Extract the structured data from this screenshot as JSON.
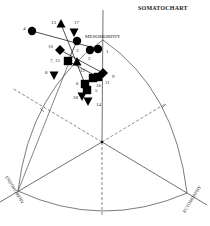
{
  "chart_data": {
    "type": "scatter",
    "title": "SOMATOCHART",
    "axes": {
      "mesomorphy": "MESOMORPHY",
      "endomorphy": "ENDOMORPHY",
      "ectomorphy": "ECTOMORPHY"
    },
    "geometry": {
      "center": [
        102,
        142
      ],
      "meso_apex": [
        103,
        40
      ],
      "endo_apex": [
        18,
        191
      ],
      "ecto_apex": [
        187,
        193
      ],
      "bottom": [
        102,
        217
      ]
    },
    "points": [
      {
        "label": "1",
        "shape": "circle",
        "x": 98,
        "y": 49,
        "lx": 106,
        "ly": 53
      },
      {
        "label": "2",
        "shape": "circle",
        "x": 90,
        "y": 50,
        "lx": 88,
        "ly": 60
      },
      {
        "label": "3",
        "shape": "circle",
        "x": 77,
        "y": 41,
        "lx": 76,
        "ly": 52
      },
      {
        "label": "4",
        "shape": "circle",
        "x": 32,
        "y": 31,
        "lx": 23,
        "ly": 30
      },
      {
        "label": "5",
        "shape": "square",
        "x": 87,
        "y": 90,
        "lx": 95,
        "ly": 92
      },
      {
        "label": "6",
        "shape": "square",
        "x": 85,
        "y": 84,
        "lx": 76,
        "ly": 85
      },
      {
        "label": "7, 15",
        "shape": "square",
        "x": 68,
        "y": 61,
        "lx": 50,
        "ly": 62
      },
      {
        "label": "8",
        "shape": "triangle-down",
        "x": 54,
        "y": 75,
        "lx": 45,
        "ly": 74
      },
      {
        "label": "9",
        "shape": "diamond",
        "x": 103,
        "y": 73,
        "lx": 112,
        "ly": 78
      },
      {
        "label": "10",
        "shape": "diamond",
        "x": 60,
        "y": 50,
        "lx": 48,
        "ly": 48
      },
      {
        "label": "11",
        "shape": "square",
        "x": 98,
        "y": 77,
        "lx": 105,
        "ly": 84
      },
      {
        "label": "12",
        "shape": "triangle-up",
        "x": 77,
        "y": 62,
        "lx": 80,
        "ly": 72
      },
      {
        "label": "13",
        "shape": "triangle-up",
        "x": 61,
        "y": 24,
        "lx": 51,
        "ly": 24
      },
      {
        "label": "14",
        "shape": "triangle-down",
        "x": 88,
        "y": 101,
        "lx": 96,
        "ly": 106
      },
      {
        "label": "16",
        "shape": "square",
        "x": 93,
        "y": 78,
        "lx": 96,
        "ly": 87
      },
      {
        "label": "17",
        "shape": "triangle-down",
        "x": 74,
        "y": 32,
        "lx": 74,
        "ly": 24
      },
      {
        "label": "18",
        "shape": "triangle-down",
        "x": 82,
        "y": 96,
        "lx": 73,
        "ly": 99
      }
    ],
    "lines": [
      {
        "from": [
          32,
          31
        ],
        "to": [
          98,
          49
        ]
      },
      {
        "from": [
          61,
          24
        ],
        "to": [
          85,
          84
        ]
      },
      {
        "from": [
          60,
          50
        ],
        "to": [
          103,
          73
        ]
      },
      {
        "from": [
          68,
          61
        ],
        "to": [
          98,
          77
        ]
      },
      {
        "from": [
          77,
          41
        ],
        "to": [
          68,
          61
        ]
      }
    ]
  }
}
